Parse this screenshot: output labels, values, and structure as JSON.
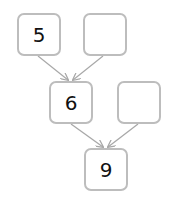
{
  "diagram": {
    "type": "addition-tree",
    "colors": {
      "box_border": "#bdbdbd",
      "arrow": "#a8a8a8",
      "text": "#111111",
      "background": "#ffffff"
    },
    "nodes": [
      {
        "id": "top-left",
        "value": "5",
        "row": 1
      },
      {
        "id": "top-right",
        "value": "",
        "row": 1
      },
      {
        "id": "middle-left",
        "value": "6",
        "row": 2
      },
      {
        "id": "middle-right",
        "value": "",
        "row": 2
      },
      {
        "id": "bottom",
        "value": "9",
        "row": 3
      }
    ],
    "edges": [
      {
        "from": "top-left",
        "to": "middle-left"
      },
      {
        "from": "top-right",
        "to": "middle-left"
      },
      {
        "from": "middle-left",
        "to": "bottom"
      },
      {
        "from": "middle-right",
        "to": "bottom"
      }
    ]
  }
}
